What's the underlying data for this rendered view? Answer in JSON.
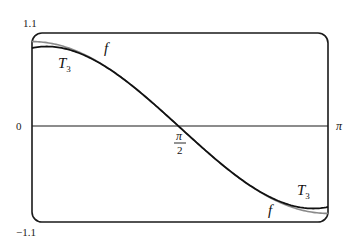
{
  "chart_data": {
    "type": "line",
    "title": "",
    "xlabel": "",
    "ylabel": "",
    "xlim": [
      0,
      3.14159
    ],
    "ylim": [
      -1.1,
      1.1
    ],
    "grid": false,
    "legend": "inline labels",
    "x_ticks": [
      {
        "value": 1.5708,
        "label": "π/2"
      },
      {
        "value": 3.14159,
        "label": "π"
      }
    ],
    "y_ticks": [
      {
        "value": 1.1,
        "label": "1.1"
      },
      {
        "value": 0,
        "label": "0"
      },
      {
        "value": -1.1,
        "label": "-1.1"
      }
    ],
    "series": [
      {
        "name": "f",
        "color": "#888888",
        "x": [
          0,
          0.3927,
          0.7854,
          1.1781,
          1.5708,
          1.9635,
          2.3562,
          2.7489,
          3.14159
        ],
        "values": [
          1.0,
          0.924,
          0.707,
          0.383,
          0.0,
          -0.383,
          -0.707,
          -0.924,
          -1.0
        ]
      },
      {
        "name": "T3",
        "color": "#111111",
        "x": [
          0,
          0.3927,
          0.7854,
          1.1781,
          1.5708,
          1.9635,
          2.3562,
          2.7489,
          3.14159
        ],
        "values": [
          0.925,
          0.907,
          0.705,
          0.383,
          0.0,
          -0.383,
          -0.705,
          -0.907,
          -0.925
        ]
      }
    ],
    "annotations": [
      {
        "text": "f",
        "near": "upper-left curve, above"
      },
      {
        "text": "T3",
        "near": "upper-left curve, below"
      },
      {
        "text": "f",
        "near": "lower-right curve, below"
      },
      {
        "text": "T3",
        "near": "lower-right curve, above"
      }
    ]
  },
  "labels": {
    "y_top": "1.1",
    "y_zero": "0",
    "y_bottom": "−1.1",
    "x_pi": "π",
    "x_half_num": "π",
    "x_half_den": "2",
    "f_upper": "f",
    "t3_upper": "T",
    "t3_upper_sub": "3",
    "f_lower": "f",
    "t3_lower": "T",
    "t3_lower_sub": "3"
  }
}
